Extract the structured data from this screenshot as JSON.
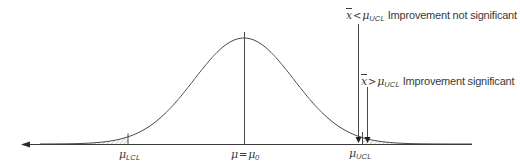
{
  "diagram": {
    "type": "normal-distribution-hypothesis-test",
    "curve": {
      "peak_x": 244,
      "peak_y": 38,
      "baseline_y": 144,
      "sigma_px": 50
    },
    "colors": {
      "line": "#4a4a4a",
      "hatch": "#8a8a8a",
      "background": "#ffffff"
    },
    "axis_labels": {
      "lcl": {
        "symbol": "μ",
        "subscript": "LCL"
      },
      "mean": {
        "symbol": "μ",
        "operator": "=",
        "rhs_symbol": "μ",
        "rhs_subscript": "0"
      },
      "ucl": {
        "symbol": "μ",
        "subscript": "UCL"
      }
    },
    "annotations": [
      {
        "xbar": "x",
        "operator": "<",
        "symbol": "μ",
        "subscript": "UCL",
        "text": "Improvement not significant"
      },
      {
        "xbar": "x",
        "operator": ">",
        "symbol": "μ",
        "subscript": "UCL",
        "text": "Improvement significant"
      }
    ]
  }
}
